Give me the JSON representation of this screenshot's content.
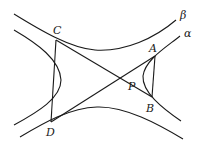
{
  "diagram": {
    "colors": {
      "stroke": "#1a1a1a",
      "background": "#ffffff"
    },
    "labels": {
      "beta": "β",
      "alpha": "α",
      "A": "A",
      "B": "B",
      "C": "C",
      "D": "D",
      "P": "P"
    },
    "points": {
      "A": [
        155,
        56
      ],
      "B": [
        152,
        97
      ],
      "C": [
        56,
        40
      ],
      "D": [
        51,
        122
      ],
      "P": [
        133,
        77
      ]
    },
    "curves": [
      {
        "name": "alpha-left-branch",
        "label": "α"
      },
      {
        "name": "alpha-right-branch",
        "label": "α"
      },
      {
        "name": "beta-upper-branch",
        "label": "β"
      },
      {
        "name": "beta-lower-branch",
        "label": "β"
      }
    ],
    "segments": [
      "CD",
      "AB",
      "CB",
      "DA"
    ]
  }
}
